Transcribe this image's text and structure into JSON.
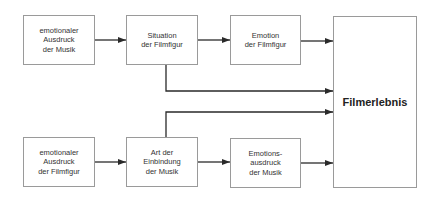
{
  "diagram": {
    "nodes": [
      {
        "id": "emo-ausdruck-musik",
        "label": "emotionaler\nAusdruck\nder Musik"
      },
      {
        "id": "situation-filmfigur",
        "label": "Situation\nder Filmfigur"
      },
      {
        "id": "emotion-filmfigur",
        "label": "Emotion\nder Filmfigur"
      },
      {
        "id": "filmerlebnis",
        "label": "Filmerlebnis"
      },
      {
        "id": "emo-ausdruck-filmfigur",
        "label": "emotionaler\nAusdruck\nder Filmfigur"
      },
      {
        "id": "art-einbindung-musik",
        "label": "Art der\nEinbindung\nder Musik"
      },
      {
        "id": "emotionsausdruck-musik",
        "label": "Emotions-\nausdruck\nder Musik"
      }
    ],
    "edges": [
      {
        "from": "emo-ausdruck-musik",
        "to": "situation-filmfigur"
      },
      {
        "from": "situation-filmfigur",
        "to": "emotion-filmfigur"
      },
      {
        "from": "emotion-filmfigur",
        "to": "filmerlebnis"
      },
      {
        "from": "situation-filmfigur",
        "to": "filmerlebnis"
      },
      {
        "from": "art-einbindung-musik",
        "to": "filmerlebnis"
      },
      {
        "from": "emo-ausdruck-filmfigur",
        "to": "art-einbindung-musik"
      },
      {
        "from": "art-einbindung-musik",
        "to": "emotionsausdruck-musik"
      },
      {
        "from": "emotionsausdruck-musik",
        "to": "filmerlebnis"
      }
    ],
    "colors": {
      "line": "#2a2a2a",
      "border": "#9a9a9a",
      "text": "#333333"
    }
  }
}
